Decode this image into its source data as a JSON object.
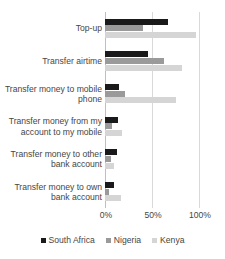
{
  "chart_data": {
    "type": "bar",
    "orientation": "horizontal",
    "title": "",
    "xlabel": "",
    "ylabel": "",
    "xlim": [
      0,
      100
    ],
    "xticks": [
      "0%",
      "50%",
      "100%"
    ],
    "xtick_values": [
      0,
      50,
      100
    ],
    "grid": true,
    "legend_position": "bottom",
    "categories": [
      "Top-up",
      "Transfer airtime",
      "Transfer money to mobile phone",
      "Transfer money from my account to my mobile",
      "Transfer money to other bank account",
      "Transfer money to own bank account"
    ],
    "series": [
      {
        "name": "South Africa",
        "color": "#1a1a1a",
        "values": [
          66,
          45,
          15,
          14,
          13,
          9
        ]
      },
      {
        "name": "Nigeria",
        "color": "#9a9a9a",
        "values": [
          40,
          62,
          21,
          7,
          6,
          4
        ]
      },
      {
        "name": "Kenya",
        "color": "#d5d5d5",
        "values": [
          96,
          81,
          75,
          18,
          9,
          17
        ]
      }
    ]
  },
  "legend": {
    "items": [
      {
        "label": "South Africa",
        "color": "#1a1a1a"
      },
      {
        "label": "Nigeria",
        "color": "#9a9a9a"
      },
      {
        "label": "Kenya",
        "color": "#d5d5d5"
      }
    ]
  }
}
